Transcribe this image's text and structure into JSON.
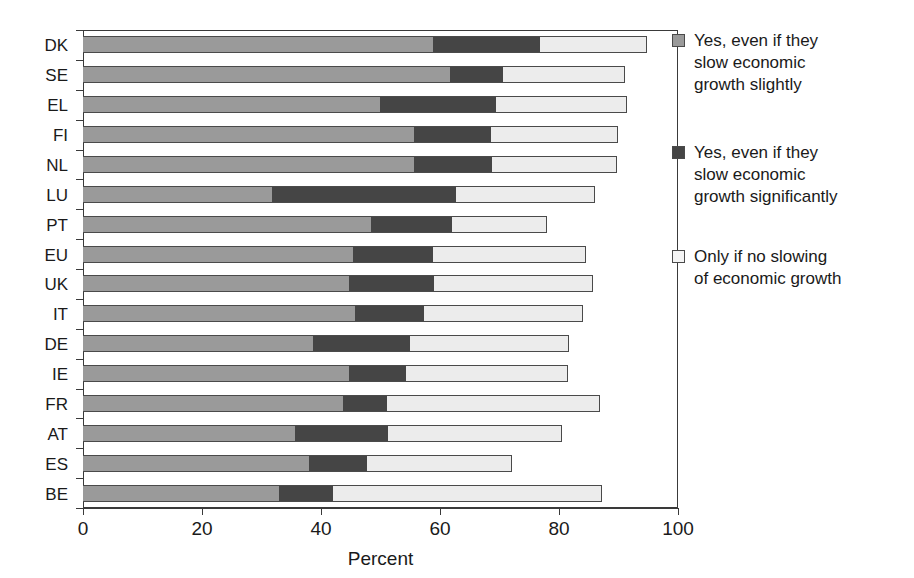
{
  "chart_data": {
    "type": "bar",
    "subtype": "stacked-horizontal",
    "title": "",
    "xlabel": "Percent",
    "ylabel": "",
    "xlim": [
      0,
      100
    ],
    "xticks": [
      0,
      20,
      40,
      60,
      80,
      100
    ],
    "xticklabels": [
      "0",
      "20",
      "40",
      "60",
      "80",
      "100"
    ],
    "grid": false,
    "legend_position": "right",
    "categories": [
      "DK",
      "SE",
      "EL",
      "FI",
      "NL",
      "LU",
      "PT",
      "EU",
      "UK",
      "IT",
      "DE",
      "IE",
      "FR",
      "AT",
      "ES",
      "BE"
    ],
    "series": [
      {
        "name": "Yes, even if they slow economic growth slightly",
        "color": "#9a9a9a",
        "values": [
          58.8,
          61.7,
          49.9,
          55.6,
          55.6,
          31.8,
          48.4,
          45.4,
          44.7,
          45.7,
          38.7,
          44.7,
          43.7,
          35.6,
          38.0,
          32.9
        ]
      },
      {
        "name": "Yes, even if they slow economic growth significantly",
        "color": "#454545",
        "values": [
          18.0,
          8.9,
          19.5,
          13.0,
          13.1,
          30.9,
          13.6,
          13.4,
          14.3,
          11.6,
          16.3,
          9.6,
          7.4,
          15.7,
          9.7,
          9.1
        ]
      },
      {
        "name": "Only if no slowing of economic growth",
        "color": "#ececec",
        "values": [
          18.0,
          20.5,
          22.0,
          21.3,
          21.0,
          23.4,
          16.0,
          25.7,
          26.7,
          26.7,
          26.7,
          27.2,
          35.8,
          29.2,
          24.4,
          45.2
        ]
      }
    ],
    "cumulative_boundaries": [
      {
        "category": "DK",
        "s1_end": 58.8,
        "s2_end": 76.8,
        "total": 94.8
      },
      {
        "category": "SE",
        "s1_end": 61.7,
        "s2_end": 70.6,
        "total": 91.1
      },
      {
        "category": "EL",
        "s1_end": 49.9,
        "s2_end": 69.4,
        "total": 91.4
      },
      {
        "category": "FI",
        "s1_end": 55.6,
        "s2_end": 68.6,
        "total": 89.9
      },
      {
        "category": "NL",
        "s1_end": 55.6,
        "s2_end": 68.7,
        "total": 89.7
      },
      {
        "category": "LU",
        "s1_end": 31.8,
        "s2_end": 62.7,
        "total": 86.1
      },
      {
        "category": "PT",
        "s1_end": 48.4,
        "s2_end": 62.0,
        "total": 78.0
      },
      {
        "category": "EU",
        "s1_end": 45.4,
        "s2_end": 58.8,
        "total": 84.5
      },
      {
        "category": "UK",
        "s1_end": 44.7,
        "s2_end": 59.0,
        "total": 85.7
      },
      {
        "category": "IT",
        "s1_end": 45.7,
        "s2_end": 57.3,
        "total": 84.0
      },
      {
        "category": "DE",
        "s1_end": 38.7,
        "s2_end": 55.0,
        "total": 81.7
      },
      {
        "category": "IE",
        "s1_end": 44.7,
        "s2_end": 54.3,
        "total": 81.5
      },
      {
        "category": "FR",
        "s1_end": 43.7,
        "s2_end": 51.1,
        "total": 86.9
      },
      {
        "category": "AT",
        "s1_end": 35.6,
        "s2_end": 51.3,
        "total": 80.5
      },
      {
        "category": "ES",
        "s1_end": 38.0,
        "s2_end": 47.7,
        "total": 72.1
      },
      {
        "category": "BE",
        "s1_end": 32.9,
        "s2_end": 42.0,
        "total": 87.2
      }
    ]
  },
  "axis": {
    "x_title": "Percent"
  },
  "legend": {
    "entries": [
      {
        "swatch": "sw-a",
        "label": "Yes, even if they\nslow economic\ngrowth slightly"
      },
      {
        "swatch": "sw-b",
        "label": "Yes, even if they\nslow economic\ngrowth significantly"
      },
      {
        "swatch": "sw-c",
        "label": "Only if no slowing\nof economic growth"
      }
    ]
  }
}
